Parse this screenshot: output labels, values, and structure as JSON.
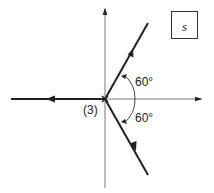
{
  "diagram": {
    "type": "root-locus",
    "plane_label": "s",
    "pole_multiplicity_label": "(3)",
    "angle_labels": [
      "60°",
      "60°"
    ],
    "branches": [
      {
        "name": "upper",
        "direction": "up-right",
        "angle_deg": 60
      },
      {
        "name": "lower",
        "direction": "down-right",
        "angle_deg": -60
      },
      {
        "name": "real-axis",
        "direction": "left",
        "angle_deg": 180
      }
    ],
    "colors": {
      "locus": "#222222",
      "axis": "#555555"
    }
  }
}
